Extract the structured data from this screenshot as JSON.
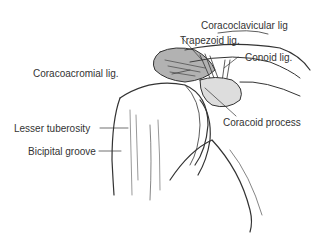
{
  "figure": {
    "labels": {
      "coracoclavicular": "Coracoclavicular lig",
      "trapezoid": "Trapezoid lig.",
      "conoid": "Conoid lig.",
      "coracoacromial": "Coracoacromial lig.",
      "coracoid_process": "Coracoid process",
      "lesser_tuberosity": "Lesser tuberosity",
      "bicipital_groove": "Bicipital groove"
    }
  }
}
